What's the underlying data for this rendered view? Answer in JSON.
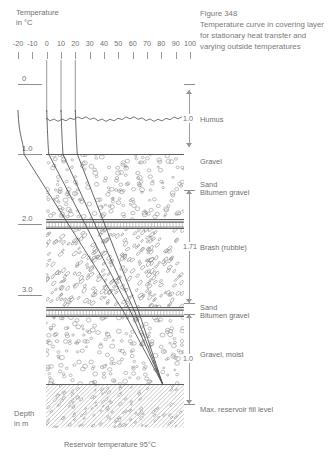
{
  "caption": {
    "figure_number": "Figure 348",
    "text": "Temperature curve in covering layer for stationary heat transfer and varying outside temperatures"
  },
  "temperature_axis": {
    "title_line1": "Temperature",
    "title_line2": "in °C",
    "ticks": [
      -20,
      -10,
      0,
      10,
      20,
      30,
      40,
      50,
      60,
      70,
      80,
      90,
      100
    ],
    "tick_labels": [
      "-20",
      "-10",
      "0",
      "10",
      "20",
      "30",
      "40",
      "50",
      "60",
      "70",
      "80",
      "90",
      "100"
    ],
    "min": -20,
    "max": 100
  },
  "depth_axis": {
    "unit_line1": "Depth",
    "unit_line2": "in m",
    "ticks": [
      {
        "label": "0",
        "depth": 0.0
      },
      {
        "label": "1.0",
        "depth": 1.0
      },
      {
        "label": "2.0",
        "depth": 2.0
      },
      {
        "label": "3.0",
        "depth": 3.0
      }
    ],
    "min": 0.0,
    "max": 3.71
  },
  "layers": [
    {
      "name": "Humus",
      "pattern": "humus",
      "top_depth": 0.0,
      "bottom_depth": 1.0
    },
    {
      "name": "Gravel",
      "pattern": "gravel",
      "top_depth": 1.0,
      "bottom_depth": 1.93
    },
    {
      "name": "Sand",
      "pattern": "sand",
      "top_depth": 1.93,
      "bottom_depth": 1.97
    },
    {
      "name": "Bitumen gravel",
      "pattern": "bitumen",
      "top_depth": 1.97,
      "bottom_depth": 2.05
    },
    {
      "name": "Brash (rubble)",
      "pattern": "brash",
      "top_depth": 2.05,
      "bottom_depth": 3.18
    },
    {
      "name": "Sand",
      "pattern": "sand",
      "top_depth": 3.18,
      "bottom_depth": 3.22
    },
    {
      "name": "Bitumen gravel",
      "pattern": "bitumen",
      "top_depth": 3.22,
      "bottom_depth": 3.3
    },
    {
      "name": "Gravel, moist",
      "pattern": "gravel",
      "top_depth": 3.3,
      "bottom_depth": 4.28
    },
    {
      "name": "Max. reservoir fill level",
      "pattern": "reservoir",
      "top_depth": 4.28,
      "bottom_depth": 4.9
    }
  ],
  "material_labels": [
    {
      "text": "Humus",
      "y": 115
    },
    {
      "text": "Gravel",
      "y": 157
    },
    {
      "text": "Sand",
      "y": 180
    },
    {
      "text": "Bitumen gravel",
      "y": 188
    },
    {
      "text": "Brash (rubble)",
      "y": 243
    },
    {
      "text": "Sand",
      "y": 303
    },
    {
      "text": "Bitumen gravel",
      "y": 311
    },
    {
      "text": "Gravel, moist",
      "y": 350
    },
    {
      "text": "Max. reservoir fill level",
      "y": 405
    }
  ],
  "dimensions": [
    {
      "value": "1.0",
      "top": 90,
      "bottom": 147
    },
    {
      "value": "1.71",
      "top": 190,
      "bottom": 303
    },
    {
      "value": "1.0",
      "top": 314,
      "bottom": 404
    }
  ],
  "curves": {
    "description": "Temperature profiles for varying outside temperatures converging at reservoir",
    "start_temperatures": [
      -20,
      0,
      10,
      20
    ],
    "reservoir_temperature": 95
  },
  "bottom_caption": "Reservoir temperature  95°C",
  "colors": {
    "line": "#5d5d5d",
    "text": "#6f6f6f",
    "curve": "#4a4a4a",
    "background": "#ffffff"
  }
}
